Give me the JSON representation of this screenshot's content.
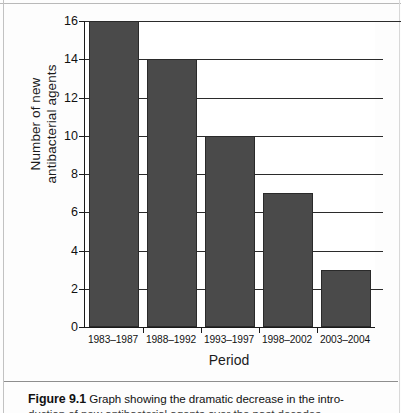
{
  "figure": {
    "caption_number": "Figure 9.1",
    "caption_line1": "Graph showing the dramatic decrease in the intro-",
    "caption_line2": "duction of new antibacterial agents over the past decades"
  },
  "chart_data": {
    "type": "bar",
    "title": "",
    "categories": [
      "1983–1987",
      "1988–1992",
      "1993–1997",
      "1998–2002",
      "2003–2004"
    ],
    "values": [
      16,
      14,
      10,
      7,
      3
    ],
    "xlabel": "Period",
    "ylabel_line1": "Number of new",
    "ylabel_line2": "antibacterial agents",
    "ylim": [
      0,
      16
    ],
    "yticks": [
      0,
      2,
      4,
      6,
      8,
      10,
      12,
      14,
      16
    ],
    "ytick_labels": [
      "0",
      "2",
      "4",
      "6",
      "8",
      "10",
      "12",
      "14",
      "16"
    ],
    "grid": true,
    "legend": "none",
    "bar_color": "#4a4a4a",
    "bar_edge_color": "#2a2a2a",
    "axis_color": "#1a1a1a",
    "grid_color": "#2b2b2b",
    "background": "#ffffff"
  }
}
